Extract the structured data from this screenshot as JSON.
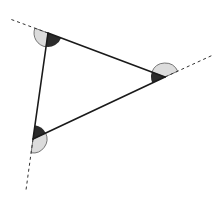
{
  "diagram": {
    "colors": {
      "background": "#ffffff",
      "side": "#1a1a1a",
      "extension": "#333333",
      "interior_angle": "#2b2b2b",
      "exterior_angle": "#dcdcdc",
      "exterior_outline": "#555555"
    },
    "vertices": [
      {
        "id": "A",
        "x": 48,
        "y": 33
      },
      {
        "id": "B",
        "x": 165,
        "y": 77
      },
      {
        "id": "C",
        "x": 33,
        "y": 139
      }
    ],
    "extensions": [
      {
        "from": "A",
        "x2": 10,
        "y2": 19
      },
      {
        "from": "B",
        "x2": 213,
        "y2": 55
      },
      {
        "from": "C",
        "x2": 26,
        "y2": 190
      }
    ],
    "angle_radius": 14
  }
}
